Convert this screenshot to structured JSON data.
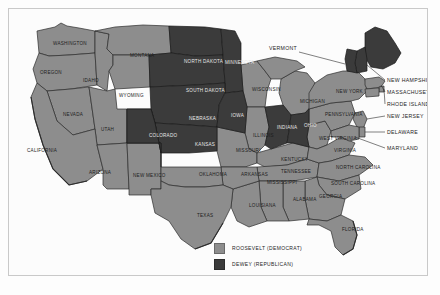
{
  "map": {
    "title": "1944 United States Presidential Election Results Map",
    "colors": {
      "democrat_fill": "#8d8d8d",
      "republican_fill": "#3b3b3b",
      "border_stroke": "#2c2c2c",
      "paper_background": "#fcfcfc",
      "frame_border": "#c9c9c9"
    },
    "states": [
      {
        "code": "WA",
        "label": "WASHINGTON",
        "party": "democrat",
        "lx": 44,
        "ly": 36
      },
      {
        "code": "OR",
        "label": "OREGON",
        "party": "democrat",
        "lx": 31,
        "ly": 65
      },
      {
        "code": "ID",
        "label": "IDAHO",
        "party": "democrat",
        "lx": 74,
        "ly": 73
      },
      {
        "code": "MT",
        "label": "MONTANA",
        "party": "democrat",
        "lx": 121,
        "ly": 48
      },
      {
        "code": "WY",
        "label": "WYOMING",
        "party": "democrat",
        "lx": 110,
        "ly": 88
      },
      {
        "code": "NV",
        "label": "NEVADA",
        "party": "democrat",
        "lx": 54,
        "ly": 107
      },
      {
        "code": "UT",
        "label": "UTAH",
        "party": "democrat",
        "lx": 92,
        "ly": 122
      },
      {
        "code": "CA",
        "label": "CALIFORNIA",
        "party": "democrat",
        "lx": 18,
        "ly": 143
      },
      {
        "code": "AZ",
        "label": "ARIZONA",
        "party": "democrat",
        "lx": 80,
        "ly": 165
      },
      {
        "code": "NM",
        "label": "NEW MEXICO",
        "party": "democrat",
        "lx": 124,
        "ly": 168
      },
      {
        "code": "CO",
        "label": "COLORADO",
        "party": "republican",
        "lx": 140,
        "ly": 128
      },
      {
        "code": "ND",
        "label": "NORTH DAKOTA",
        "party": "republican",
        "lx": 175,
        "ly": 54
      },
      {
        "code": "SD",
        "label": "SOUTH DAKOTA",
        "party": "republican",
        "lx": 177,
        "ly": 83
      },
      {
        "code": "NE",
        "label": "NEBRASKA",
        "party": "republican",
        "lx": 180,
        "ly": 111
      },
      {
        "code": "KS",
        "label": "KANSAS",
        "party": "republican",
        "lx": 186,
        "ly": 137
      },
      {
        "code": "IA",
        "label": "IOWA",
        "party": "republican",
        "lx": 222,
        "ly": 108
      },
      {
        "code": "MN",
        "label": "MINNESOTA",
        "party": "republican",
        "lx": 216,
        "ly": 55
      },
      {
        "code": "WI",
        "label": "WISCONSIN",
        "party": "democrat",
        "lx": 243,
        "ly": 82
      },
      {
        "code": "MI",
        "label": "MICHIGAN",
        "party": "democrat",
        "lx": 291,
        "ly": 94
      },
      {
        "code": "IL",
        "label": "ILLINOIS",
        "party": "democrat",
        "lx": 244,
        "ly": 128
      },
      {
        "code": "MO",
        "label": "MISSOURI",
        "party": "democrat",
        "lx": 227,
        "ly": 143
      },
      {
        "code": "IN",
        "label": "INDIANA",
        "party": "republican",
        "lx": 268,
        "ly": 120
      },
      {
        "code": "OH",
        "label": "OHIO",
        "party": "republican",
        "lx": 295,
        "ly": 118
      },
      {
        "code": "KY",
        "label": "KENTUCKY",
        "party": "democrat",
        "lx": 272,
        "ly": 152
      },
      {
        "code": "TN",
        "label": "TENNESSEE",
        "party": "democrat",
        "lx": 272,
        "ly": 164
      },
      {
        "code": "WV",
        "label": "WEST VIRGINIA",
        "party": "democrat",
        "lx": 310,
        "ly": 131
      },
      {
        "code": "VA",
        "label": "VIRGINIA",
        "party": "democrat",
        "lx": 325,
        "ly": 143
      },
      {
        "code": "PA",
        "label": "PENNSYLVANIA",
        "party": "democrat",
        "lx": 316,
        "ly": 107
      },
      {
        "code": "NY",
        "label": "NEW YORK",
        "party": "democrat",
        "lx": 327,
        "ly": 84
      },
      {
        "code": "NC",
        "label": "NORTH CAROLINA",
        "party": "democrat",
        "lx": 327,
        "ly": 160
      },
      {
        "code": "SC",
        "label": "SOUTH CAROLINA",
        "party": "democrat",
        "lx": 322,
        "ly": 176
      },
      {
        "code": "GA",
        "label": "GEORGIA",
        "party": "democrat",
        "lx": 310,
        "ly": 189
      },
      {
        "code": "AL",
        "label": "ALABAMA",
        "party": "democrat",
        "lx": 284,
        "ly": 192
      },
      {
        "code": "MS",
        "label": "MISSISSIPPI",
        "party": "democrat",
        "lx": 258,
        "ly": 175
      },
      {
        "code": "FL",
        "label": "FLORIDA",
        "party": "democrat",
        "lx": 333,
        "ly": 222
      },
      {
        "code": "LA",
        "label": "LOUISIANA",
        "party": "democrat",
        "lx": 240,
        "ly": 198
      },
      {
        "code": "AR",
        "label": "ARKANSAS",
        "party": "democrat",
        "lx": 232,
        "ly": 167
      },
      {
        "code": "OK",
        "label": "OKLAHOMA",
        "party": "democrat",
        "lx": 190,
        "ly": 167
      },
      {
        "code": "TX",
        "label": "TEXAS",
        "party": "democrat",
        "lx": 188,
        "ly": 208
      },
      {
        "code": "ME",
        "label": "MAINE",
        "party": "republican",
        "lx": 0,
        "ly": 0
      },
      {
        "code": "VT",
        "label": "VERMONT",
        "party": "republican",
        "lx": 0,
        "ly": 0
      },
      {
        "code": "NH",
        "label": "NEW HAMPSHIRE",
        "party": "republican",
        "lx": 0,
        "ly": 0
      },
      {
        "code": "MA",
        "label": "MASSACHUSETTS",
        "party": "democrat",
        "lx": 0,
        "ly": 0
      },
      {
        "code": "RI",
        "label": "RHODE ISLAND",
        "party": "democrat",
        "lx": 0,
        "ly": 0
      },
      {
        "code": "CT",
        "label": "CONNECTICUT",
        "party": "democrat",
        "lx": 0,
        "ly": 0
      },
      {
        "code": "NJ",
        "label": "NEW JERSEY",
        "party": "democrat",
        "lx": 0,
        "ly": 0
      },
      {
        "code": "DE",
        "label": "DELAWARE",
        "party": "democrat",
        "lx": 0,
        "ly": 0
      },
      {
        "code": "MD",
        "label": "MARYLAND",
        "party": "democrat",
        "lx": 0,
        "ly": 0
      }
    ],
    "callout_labels": [
      {
        "name": "vermont",
        "text": "VERMONT",
        "tx": 288,
        "ty": 41,
        "anchor": "end"
      },
      {
        "name": "new-hampshire",
        "text": "NEW HAMPSHIRE",
        "tx": 378,
        "ty": 73,
        "anchor": "start"
      },
      {
        "name": "massachusetts",
        "text": "MASSACHUSETTS",
        "tx": 378,
        "ty": 85,
        "anchor": "start"
      },
      {
        "name": "rhode-island",
        "text": "RHODE ISLAND",
        "tx": 378,
        "ty": 97,
        "anchor": "start"
      },
      {
        "name": "new-jersey",
        "text": "NEW JERSEY",
        "tx": 378,
        "ty": 109,
        "anchor": "start"
      },
      {
        "name": "delaware",
        "text": "DELAWARE",
        "tx": 378,
        "ty": 125,
        "anchor": "start"
      },
      {
        "name": "maryland",
        "text": "MARYLAND",
        "tx": 378,
        "ty": 141,
        "anchor": "start"
      }
    ]
  },
  "legend": {
    "items": [
      {
        "key": "democrat",
        "label": "ROOSEVELT (DEMOCRAT)",
        "color": "#8d8d8d"
      },
      {
        "key": "republican",
        "label": "DEWEY (REPUBLICAN)",
        "color": "#3b3b3b"
      }
    ]
  },
  "caption": {
    "text": ""
  }
}
